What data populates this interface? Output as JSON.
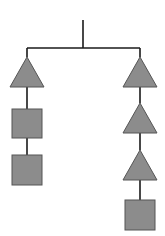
{
  "diagram": {
    "type": "mobile-tree",
    "colors": {
      "line": "#1a1a1a",
      "fill": "#8c8c8c",
      "stroke": "#555555",
      "background": "#ffffff"
    },
    "root": {
      "x": 83,
      "y_top": 20,
      "y_bar": 48
    },
    "branches": [
      {
        "name": "left",
        "x": 27,
        "shapes": [
          {
            "kind": "triangle",
            "top": 57,
            "bottom": 87,
            "half_width": 17
          },
          {
            "kind": "square",
            "top": 109,
            "bottom": 138,
            "half_width": 15
          },
          {
            "kind": "square",
            "top": 155,
            "bottom": 185,
            "half_width": 15
          }
        ]
      },
      {
        "name": "right",
        "x": 140,
        "shapes": [
          {
            "kind": "triangle",
            "top": 57,
            "bottom": 87,
            "half_width": 17
          },
          {
            "kind": "triangle",
            "top": 103,
            "bottom": 133,
            "half_width": 17
          },
          {
            "kind": "triangle",
            "top": 150,
            "bottom": 180,
            "half_width": 17
          },
          {
            "kind": "square",
            "top": 200,
            "bottom": 230,
            "half_width": 15
          }
        ]
      }
    ]
  }
}
